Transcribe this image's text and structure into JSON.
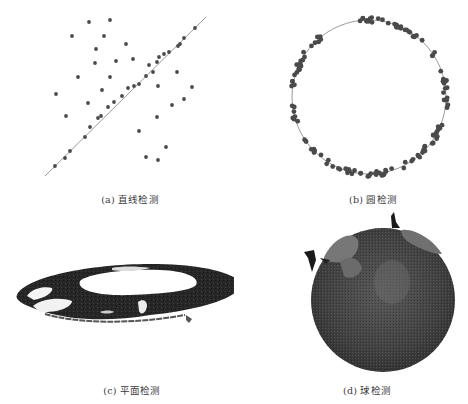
{
  "figure": {
    "panels": [
      {
        "id": "a",
        "caption": "(a) 直线检测"
      },
      {
        "id": "b",
        "caption": "(b) 圆检测"
      },
      {
        "id": "c",
        "caption": "(c) 平面检测"
      },
      {
        "id": "d",
        "caption": "(d) 球检测"
      }
    ]
  },
  "colors": {
    "point": "#4a4a4a",
    "fit_line": "#9a9a9a",
    "plane_dark": "#262626",
    "sphere_dark": "#3c3c3c",
    "sphere_light": "#6e6e6e"
  },
  "chart_data": [
    {
      "type": "scatter",
      "title": "(a) 直线检测",
      "xlabel": "",
      "ylabel": "",
      "grid": false,
      "fit": {
        "kind": "line",
        "from": [
          45,
          176
        ],
        "to": [
          206,
          17
        ]
      },
      "inliers": [
        [
          55,
          166
        ],
        [
          65,
          158
        ],
        [
          70,
          151
        ],
        [
          85,
          137
        ],
        [
          90,
          127
        ],
        [
          98,
          118
        ],
        [
          101,
          116
        ],
        [
          108,
          107
        ],
        [
          114,
          102
        ],
        [
          122,
          96
        ],
        [
          128,
          88
        ],
        [
          134,
          86
        ],
        [
          139,
          84
        ],
        [
          146,
          76
        ],
        [
          153,
          72
        ],
        [
          149,
          65
        ],
        [
          157,
          62
        ],
        [
          159,
          57
        ],
        [
          164,
          54
        ],
        [
          169,
          52
        ],
        [
          178,
          46
        ],
        [
          180,
          44
        ],
        [
          184,
          38
        ],
        [
          195,
          28
        ]
      ],
      "outliers": [
        [
          89,
          22
        ],
        [
          110,
          20
        ],
        [
          72,
          36
        ],
        [
          104,
          36
        ],
        [
          126,
          44
        ],
        [
          96,
          49
        ],
        [
          95,
          63
        ],
        [
          116,
          61
        ],
        [
          133,
          59
        ],
        [
          78,
          77
        ],
        [
          110,
          77
        ],
        [
          102,
          90
        ],
        [
          56,
          94
        ],
        [
          88,
          103
        ],
        [
          66,
          116
        ],
        [
          177,
          72
        ],
        [
          158,
          86
        ],
        [
          192,
          87
        ],
        [
          184,
          99
        ],
        [
          172,
          105
        ],
        [
          157,
          117
        ],
        [
          139,
          131
        ],
        [
          166,
          147
        ],
        [
          146,
          157
        ],
        [
          158,
          160
        ]
      ]
    },
    {
      "type": "scatter",
      "title": "(b) 圆检测",
      "fit": {
        "kind": "circle",
        "cx": 369,
        "cy": 97,
        "r": 77
      },
      "point_arcs_deg": [
        [
          -100,
          -30
        ],
        [
          -20,
          10
        ],
        [
          20,
          150
        ],
        [
          160,
          175
        ],
        [
          185,
          235
        ]
      ],
      "point_count_approx": 150
    },
    {
      "type": "other",
      "title": "(c) 平面检测",
      "description": "3D point cloud of an elliptical ring-shaped planar surface viewed obliquely"
    },
    {
      "type": "other",
      "title": "(d) 球检测",
      "description": "3D point cloud of a detected sphere with lighter patches on upper-left and upper-right"
    }
  ]
}
